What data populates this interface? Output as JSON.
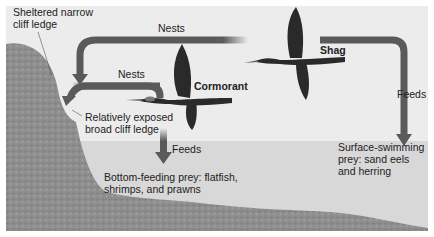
{
  "diagram": {
    "colors": {
      "sky": "#ececec",
      "water": "#d6d6d6",
      "rock": "#8e8e8e",
      "arrow": "#5a5a5a",
      "bird": "#2a2a2a"
    },
    "birds": [
      {
        "name": "Cormorant"
      },
      {
        "name": "Shag"
      }
    ],
    "labels": {
      "sheltered_line1": "Sheltered narrow",
      "sheltered_line2": "cliff ledge",
      "exposed_line1": "Relatively exposed",
      "exposed_line2": "broad cliff ledge",
      "nests_shag": "Nests",
      "nests_cormorant": "Nests",
      "feeds_cormorant": "Feeds",
      "feeds_shag": "Feeds",
      "cormorant": "Cormorant",
      "shag": "Shag",
      "bottom_line1": "Bottom-feeding prey: flatfish,",
      "bottom_line2": "shrimps, and prawns",
      "surface_line1": "Surface-swimming",
      "surface_line2": "prey: sand eels",
      "surface_line3": "and herring"
    }
  }
}
